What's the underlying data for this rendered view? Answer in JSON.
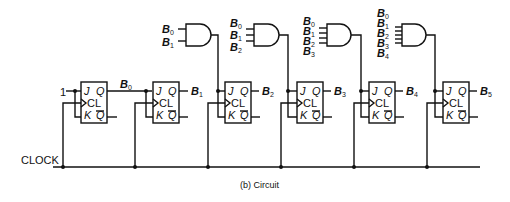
{
  "caption": "(b)  Circuit",
  "clock_label": "CLOCK",
  "input_constant": "1",
  "flip_flop_pins": {
    "j": "J",
    "q": "Q",
    "cl": "CL",
    "k": "K",
    "qbar": "Q"
  },
  "outputs": [
    "B0",
    "B1",
    "B2",
    "B3",
    "B4",
    "B5"
  ],
  "flip_flops": [
    {
      "id": "ff0",
      "output": "B",
      "output_sub": "0",
      "j_source": "1"
    },
    {
      "id": "ff1",
      "output": "B",
      "output_sub": "1",
      "j_source": "B0"
    },
    {
      "id": "ff2",
      "output": "B",
      "output_sub": "2",
      "j_source": "AND(B0,B1)"
    },
    {
      "id": "ff3",
      "output": "B",
      "output_sub": "3",
      "j_source": "AND(B0,B1,B2)"
    },
    {
      "id": "ff4",
      "output": "B",
      "output_sub": "4",
      "j_source": "AND(B0,B1,B2,B3)"
    },
    {
      "id": "ff5",
      "output": "B",
      "output_sub": "5",
      "j_source": "AND(B0,B1,B2,B3,B4)"
    }
  ],
  "and_gates": [
    {
      "id": "and2",
      "inputs": [
        "B0",
        "B1"
      ]
    },
    {
      "id": "and3",
      "inputs": [
        "B0",
        "B1",
        "B2"
      ]
    },
    {
      "id": "and4",
      "inputs": [
        "B0",
        "B1",
        "B2",
        "B3"
      ]
    },
    {
      "id": "and5",
      "inputs": [
        "B0",
        "B1",
        "B2",
        "B3",
        "B4"
      ]
    }
  ],
  "labels": {
    "b": "B",
    "s0": "0",
    "s1": "1",
    "s2": "2",
    "s3": "3",
    "s4": "4",
    "s5": "5"
  }
}
